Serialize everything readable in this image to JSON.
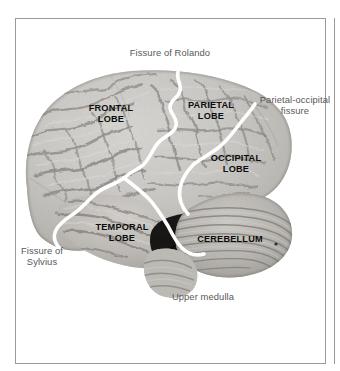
{
  "figure": {
    "frame_color": "#9a9a9a",
    "background_color": "#ffffff"
  },
  "illustration": {
    "name": "brain-lateral-photograph",
    "type": "grayscale-photograph",
    "overlay_color": "#ffffff",
    "overlay_description": "white lines tracing the major fissures"
  },
  "callout_labels": [
    {
      "id": "fissure-of-rolando",
      "text": "Fissure of Rolando"
    },
    {
      "id": "parietal-occipital-fissure",
      "text": "Parietal-occipital\nfissure"
    },
    {
      "id": "fissure-of-sylvius",
      "text": "Fissure of\nSylvius"
    },
    {
      "id": "upper-medulla",
      "text": "Upper medulla"
    }
  ],
  "region_labels": [
    {
      "id": "frontal-lobe",
      "text": "FRONTAL\nLOBE"
    },
    {
      "id": "parietal-lobe",
      "text": "PARIETAL\nLOBE"
    },
    {
      "id": "occipital-lobe",
      "text": "OCCIPITAL\nLOBE"
    },
    {
      "id": "temporal-lobe",
      "text": "TEMPORAL\nLOBE"
    },
    {
      "id": "cerebellum",
      "text": "CEREBELLUM"
    }
  ],
  "colors": {
    "callout_text": "#58585a",
    "region_text": "#0d0d0d",
    "frame": "#9a9a9a"
  }
}
